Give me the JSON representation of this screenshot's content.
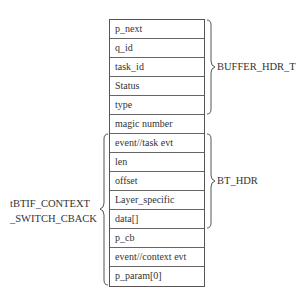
{
  "diagram": {
    "rows": [
      {
        "label": "p_next"
      },
      {
        "label": "q_id"
      },
      {
        "label": "task_id"
      },
      {
        "label": "Status"
      },
      {
        "label": "type"
      },
      {
        "label": "magic number"
      },
      {
        "label": "event//task evt"
      },
      {
        "label": "len"
      },
      {
        "label": "offset"
      },
      {
        "label": "Layer_specific"
      },
      {
        "label": "data[]"
      },
      {
        "label": "p_cb"
      },
      {
        "label": "event//context evt"
      },
      {
        "label": "p_param[0]"
      }
    ],
    "groups": {
      "buffer_hdr": {
        "label": "BUFFER_HDR_T",
        "from_row": 0,
        "to_row": 4,
        "side": "right"
      },
      "bt_hdr": {
        "label": "BT_HDR",
        "from_row": 6,
        "to_row": 10,
        "side": "right"
      },
      "context_switch": {
        "label_line1": "tBTIF_CONTEXT",
        "label_line2": "_SWITCH_CBACK",
        "from_row": 6,
        "to_row": 13,
        "side": "left"
      }
    }
  }
}
